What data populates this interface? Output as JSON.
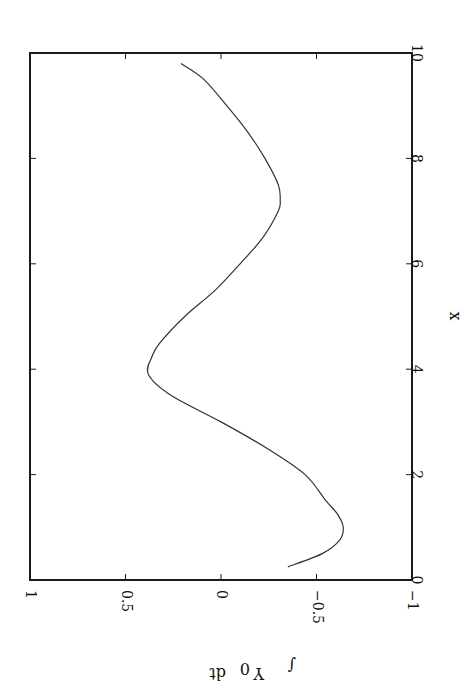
{
  "chart_data": {
    "type": "line",
    "title": "",
    "xlabel": "x",
    "ylabel": "∫ Y₀ dt",
    "xlim": [
      0,
      10
    ],
    "ylim": [
      -1,
      1
    ],
    "x_ticks": [
      0,
      2,
      4,
      6,
      8,
      10
    ],
    "x_tick_labels": [
      "0",
      "2",
      "4",
      "6",
      "8",
      "10"
    ],
    "y_ticks": [
      -1,
      -0.5,
      0,
      0.5,
      1
    ],
    "y_tick_labels": [
      "−1",
      "−0.5",
      "0",
      "0.5",
      "1"
    ],
    "grid": false,
    "legend": null,
    "orientation": "rotated 90° clockwise (x axis runs vertically, increasing upward; y axis runs horizontally, increasing leftward)",
    "series": [
      {
        "name": "∫ Y₀ dt",
        "color": "#333333",
        "x": [
          0.25,
          0.5,
          0.75,
          1.0,
          1.25,
          1.5,
          2.0,
          2.5,
          3.0,
          3.5,
          3.9,
          4.25,
          4.5,
          5.0,
          5.5,
          6.0,
          6.5,
          7.0,
          7.2,
          7.5,
          8.0,
          8.5,
          9.0,
          9.5,
          9.8
        ],
        "y": [
          -0.35,
          -0.53,
          -0.62,
          -0.64,
          -0.61,
          -0.55,
          -0.44,
          -0.24,
          0.0,
          0.26,
          0.38,
          0.36,
          0.32,
          0.19,
          0.03,
          -0.1,
          -0.22,
          -0.3,
          -0.31,
          -0.3,
          -0.23,
          -0.14,
          -0.03,
          0.09,
          0.21
        ]
      }
    ]
  },
  "axes": {
    "x_title": "x",
    "y_title_integral": "∫",
    "y_title_var": "Y",
    "y_title_sub": "0",
    "y_title_dt": "dt"
  }
}
